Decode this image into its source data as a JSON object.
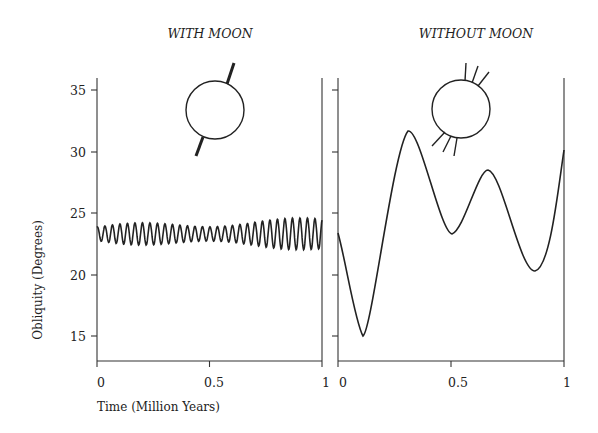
{
  "chart_data": [
    {
      "type": "line",
      "title": "WITH MOON",
      "xlabel": "Time (Million Years)",
      "ylabel": "Obliquity (Degrees)",
      "xlim": [
        0,
        1
      ],
      "ylim": [
        13,
        36
      ],
      "x_ticks": [
        "0",
        "0.5",
        "1"
      ],
      "y_ticks": [
        "15",
        "20",
        "25",
        "30",
        "35"
      ],
      "description": "Small rapid oscillation of obliquity around ~23.3 degrees, amplitude ~0.6-1.2 degrees, about 30 cycles over 1 million years, slightly larger amplitude after 0.5",
      "series": [
        {
          "name": "Obliquity with Moon",
          "mean": 23.3,
          "min": 22.2,
          "max": 24.4,
          "cycles": 30
        }
      ],
      "annotation": "Earth icon with single tilted spin axis (stable)"
    },
    {
      "type": "line",
      "title": "WITHOUT MOON",
      "xlabel": "",
      "ylabel": "",
      "xlim": [
        0,
        1
      ],
      "ylim": [
        13,
        36
      ],
      "x_ticks": [
        "0",
        "0.5",
        "1"
      ],
      "y_ticks": [
        "15",
        "20",
        "25",
        "30",
        "35"
      ],
      "series": [
        {
          "name": "Obliquity without Moon",
          "x": [
            0.0,
            0.11,
            0.3,
            0.5,
            0.66,
            0.87,
            1.0
          ],
          "y": [
            23.4,
            15.0,
            31.7,
            23.3,
            28.5,
            20.3,
            30.1
          ]
        }
      ],
      "annotation": "Earth icon with multiple spin axis positions (chaotic)"
    }
  ],
  "panels": {
    "left_title": "WITH MOON",
    "right_title": "WITHOUT MOON",
    "y_label": "Obliquity (Degrees)",
    "x_label": "Time (Million Years)",
    "y_ticks": [
      "35",
      "30",
      "25",
      "20",
      "15"
    ],
    "x_ticks_left": [
      "0",
      "0.5",
      "1"
    ],
    "x_ticks_right": [
      "0",
      "0.5",
      "1"
    ]
  }
}
